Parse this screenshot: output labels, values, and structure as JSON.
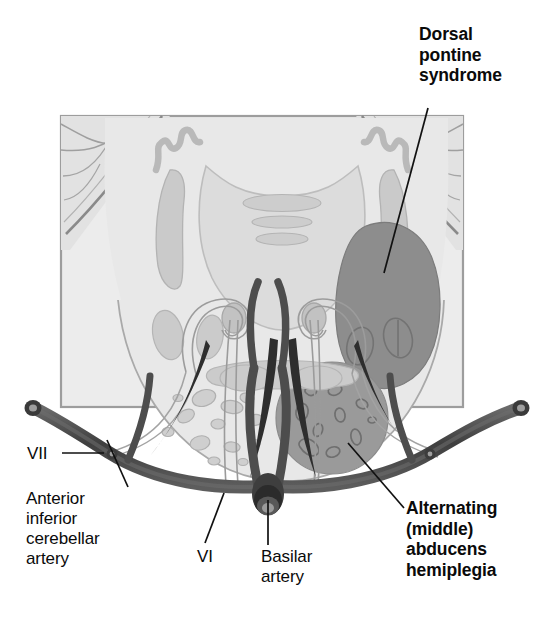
{
  "figure": {
    "type": "anatomical-diagram",
    "region": "pons",
    "panel": {
      "frame_color": "#9a9a9a",
      "background_color": "#ececec",
      "tissue_color": "#e4e4e4"
    },
    "colors": {
      "lesion_dark": "#8d8d8d",
      "lesion_ventral": "#9a9a9a",
      "structure_mid": "#cfcfcf",
      "structure_light": "#dcdcdc",
      "outline": "#808080",
      "vessel": "#4a4a4a",
      "vessel_dark": "#3a3a3a",
      "leader": "#111111",
      "text": "#0a0a0a"
    }
  },
  "labels": {
    "dorsal_pontine_syndrome": "Dorsal\npontine\nsyndrome",
    "alternating_abducens_hemiplegia": "Alternating\n(middle)\nabducens\nhemiplegia",
    "anterior_inferior_cerebellar_artery": "Anterior\ninferior\ncerebellar\nartery",
    "cranial_nerve_vii": "VII",
    "cranial_nerve_vi": "VI",
    "basilar_artery": "Basilar\nartery"
  },
  "structures": [
    {
      "name": "dorsal-pontine-lesion",
      "label": "Dorsal pontine syndrome lesion",
      "shade": "dark"
    },
    {
      "name": "ventral-pontine-lesion",
      "label": "Alternating (middle) abducens hemiplegia lesion",
      "shade": "dark"
    },
    {
      "name": "fourth-ventricle-floor",
      "label": "Floor of fourth ventricle",
      "shade": "light"
    },
    {
      "name": "middle-cerebellar-peduncle",
      "label": "Middle cerebellar peduncle",
      "shade": "mid"
    },
    {
      "name": "cerebellum",
      "label": "Cerebellum",
      "shade": "light"
    },
    {
      "name": "abducens-nucleus",
      "label": "Abducens nucleus",
      "shade": "mid"
    },
    {
      "name": "facial-nerve-genu",
      "label": "Genu of facial nerve",
      "shade": "outline"
    },
    {
      "name": "pontine-nuclei",
      "label": "Pontine nuclei",
      "shade": "mid"
    },
    {
      "name": "basilar-artery-vessel",
      "label": "Basilar artery",
      "shade": "vessel"
    },
    {
      "name": "aica-vessel",
      "label": "Anterior inferior cerebellar artery",
      "shade": "vessel"
    }
  ]
}
